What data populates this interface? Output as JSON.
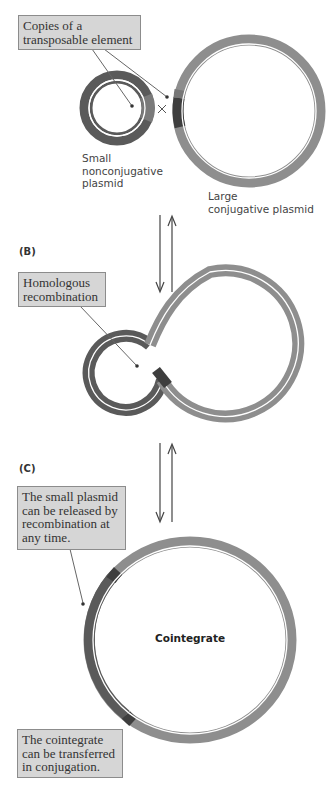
{
  "figure": {
    "panel_a": {
      "callout": "Copies of a transposable element",
      "small_plasmid_label": [
        "Small",
        "nonconjugative",
        "plasmid"
      ],
      "large_plasmid_label": [
        "Large",
        "conjugative plasmid"
      ],
      "crossover_symbol": "×"
    },
    "panel_b": {
      "panel_label": "(B)",
      "callout": "Homologous recombination"
    },
    "panel_c": {
      "panel_label": "(C)",
      "callout": "The small plasmid can be released by recombination at any time.",
      "center_label": "Cointegrate",
      "bottom_callout": "The cointegrate can be transferred in conjugation."
    },
    "colors": {
      "small_plasmid": "#5a5a5a",
      "large_plasmid": "#8e8e8e",
      "transposon": "#3e3e3e",
      "callout_fill": "#d6d6d6",
      "callout_border": "#8c8c8c",
      "strand_gap": "#ffffff"
    }
  }
}
